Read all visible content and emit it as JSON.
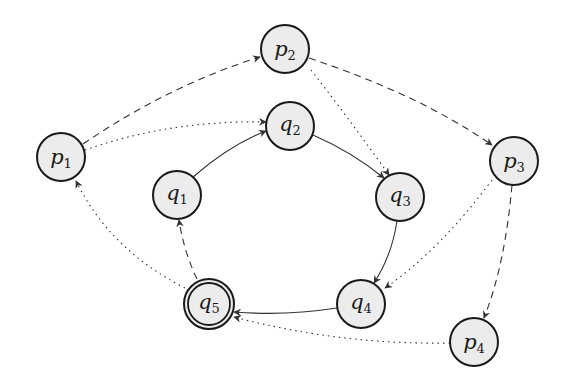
{
  "diagram": {
    "type": "automaton",
    "colors": {
      "node_fill": "#ececec",
      "node_stroke": "#1a1a1a",
      "edge": "#333333",
      "background": "#ffffff"
    },
    "nodes": [
      {
        "id": "p1",
        "base": "p",
        "sub": "1",
        "cx": 61,
        "cy": 157,
        "accepting": false
      },
      {
        "id": "p2",
        "base": "p",
        "sub": "2",
        "cx": 285,
        "cy": 49,
        "accepting": false
      },
      {
        "id": "p3",
        "base": "p",
        "sub": "3",
        "cx": 514,
        "cy": 161,
        "accepting": false
      },
      {
        "id": "p4",
        "base": "p",
        "sub": "4",
        "cx": 474,
        "cy": 342,
        "accepting": false
      },
      {
        "id": "q1",
        "base": "q",
        "sub": "1",
        "cx": 177,
        "cy": 195,
        "accepting": false
      },
      {
        "id": "q2",
        "base": "q",
        "sub": "2",
        "cx": 290,
        "cy": 126,
        "accepting": false
      },
      {
        "id": "q3",
        "base": "q",
        "sub": "3",
        "cx": 400,
        "cy": 197,
        "accepting": false
      },
      {
        "id": "q4",
        "base": "q",
        "sub": "4",
        "cx": 361,
        "cy": 304,
        "accepting": false
      },
      {
        "id": "q5",
        "base": "q",
        "sub": "5",
        "cx": 209,
        "cy": 304,
        "accepting": true
      }
    ],
    "edges": [
      {
        "from": "q1",
        "to": "q2",
        "style": "solid"
      },
      {
        "from": "q2",
        "to": "q3",
        "style": "solid"
      },
      {
        "from": "q3",
        "to": "q4",
        "style": "solid"
      },
      {
        "from": "q4",
        "to": "q5",
        "style": "solid"
      },
      {
        "from": "q5",
        "to": "q1",
        "style": "dashed"
      },
      {
        "from": "p1",
        "to": "p2",
        "style": "dashed"
      },
      {
        "from": "p2",
        "to": "p3",
        "style": "dashed"
      },
      {
        "from": "p3",
        "to": "p4",
        "style": "dashed"
      },
      {
        "from": "p1",
        "to": "q2",
        "style": "dotted"
      },
      {
        "from": "p2",
        "to": "q3",
        "style": "dotted"
      },
      {
        "from": "p3",
        "to": "q4",
        "style": "dotted"
      },
      {
        "from": "p4",
        "to": "q5",
        "style": "dotted"
      },
      {
        "from": "q5",
        "to": "p1",
        "style": "dotted"
      }
    ]
  }
}
